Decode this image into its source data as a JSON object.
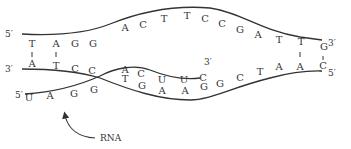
{
  "diagram": {
    "dna_top_strand": {
      "five_prime_label": "5′",
      "three_prime_label": "3′",
      "bases": [
        {
          "b": "T",
          "x": 32,
          "y": 47
        },
        {
          "b": "A",
          "x": 56,
          "y": 47
        },
        {
          "b": "G",
          "x": 75,
          "y": 47
        },
        {
          "b": "G",
          "x": 93,
          "y": 47
        },
        {
          "b": "A",
          "x": 125,
          "y": 31
        },
        {
          "b": "C",
          "x": 143,
          "y": 28
        },
        {
          "b": "T",
          "x": 164,
          "y": 22
        },
        {
          "b": "T",
          "x": 187,
          "y": 19
        },
        {
          "b": "C",
          "x": 205,
          "y": 22
        },
        {
          "b": "C",
          "x": 222,
          "y": 27
        },
        {
          "b": "G",
          "x": 240,
          "y": 33
        },
        {
          "b": "A",
          "x": 258,
          "y": 38
        },
        {
          "b": "T",
          "x": 279,
          "y": 43
        },
        {
          "b": "T",
          "x": 301,
          "y": 45
        },
        {
          "b": "G",
          "x": 324,
          "y": 50
        }
      ]
    },
    "dna_bottom_strand": {
      "three_prime_label": "3′",
      "five_prime_label": "5′",
      "bases": [
        {
          "b": "A",
          "x": 32,
          "y": 67
        },
        {
          "b": "T",
          "x": 56,
          "y": 69
        },
        {
          "b": "C",
          "x": 75,
          "y": 72
        },
        {
          "b": "C",
          "x": 92,
          "y": 74
        },
        {
          "b": "T",
          "x": 125,
          "y": 82
        },
        {
          "b": "G",
          "x": 142,
          "y": 89
        },
        {
          "b": "A",
          "x": 162,
          "y": 94
        },
        {
          "b": "A",
          "x": 185,
          "y": 94
        },
        {
          "b": "G",
          "x": 204,
          "y": 90
        },
        {
          "b": "G",
          "x": 220,
          "y": 87
        },
        {
          "b": "C",
          "x": 240,
          "y": 81
        },
        {
          "b": "T",
          "x": 260,
          "y": 75
        },
        {
          "b": "A",
          "x": 279,
          "y": 70
        },
        {
          "b": "A",
          "x": 300,
          "y": 70
        },
        {
          "b": "C",
          "x": 323,
          "y": 69
        }
      ]
    },
    "rna_strand": {
      "five_prime_label": "5′",
      "three_prime_label": "3′",
      "label": "RNA",
      "bases": [
        {
          "b": "U",
          "x": 29,
          "y": 101
        },
        {
          "b": "A",
          "x": 50,
          "y": 99
        },
        {
          "b": "G",
          "x": 74,
          "y": 97
        },
        {
          "b": "G",
          "x": 94,
          "y": 93
        },
        {
          "b": "A",
          "x": 125,
          "y": 73
        },
        {
          "b": "C",
          "x": 141,
          "y": 77
        },
        {
          "b": "U",
          "x": 162,
          "y": 83
        },
        {
          "b": "U",
          "x": 184,
          "y": 83
        },
        {
          "b": "C",
          "x": 203,
          "y": 81
        }
      ]
    },
    "base_pair_ticks": [
      {
        "x": 32,
        "y1": 52,
        "y2": 58
      },
      {
        "x": 56,
        "y1": 52,
        "y2": 58
      },
      {
        "x": 300,
        "y1": 51,
        "y2": 58
      },
      {
        "x": 323,
        "y1": 55,
        "y2": 60
      }
    ]
  }
}
